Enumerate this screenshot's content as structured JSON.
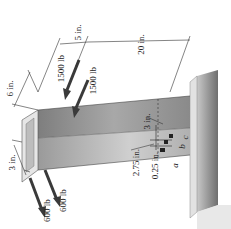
{
  "figure": {
    "colors": {
      "beam_top": "#b9b9b9",
      "beam_side": "#8e8e8e",
      "wall": "#9a9a9a",
      "arrow": "#3a3a3a",
      "line": "#333333"
    }
  },
  "dimensions": {
    "width_6in": "6 in.",
    "spacing_5in": "5 in.",
    "length_20in": "20 in.",
    "offset_3in_left": "3 in.",
    "offset_3in_right": "3 in.",
    "dist_2_75in": "2.75 in.",
    "dist_0_25in": "0.25 in."
  },
  "loads": {
    "upper_1": "1500 lb",
    "upper_2": "1500 lb",
    "lower_1": "600 lb",
    "lower_2": "600 lb"
  },
  "points": {
    "a": "a",
    "b": "b",
    "c": "c"
  }
}
